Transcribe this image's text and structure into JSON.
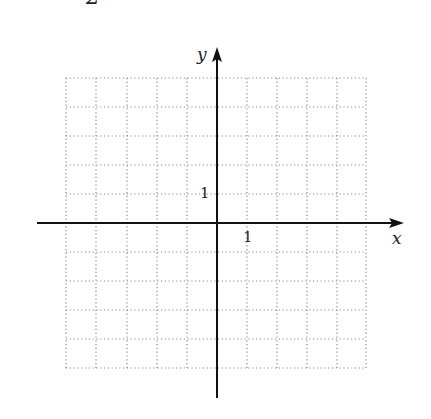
{
  "problem": {
    "partial_number": "2"
  },
  "graph": {
    "x_axis_label": "x",
    "y_axis_label": "y",
    "x_tick_label": "1",
    "y_tick_label": "1",
    "x_range": [
      -5,
      5
    ],
    "y_range": [
      -5,
      5
    ],
    "grid_step": 1,
    "grid_style": "dotted",
    "colors": {
      "axis": "#111111",
      "grid": "#8a8a8a",
      "text": "#222222"
    }
  }
}
